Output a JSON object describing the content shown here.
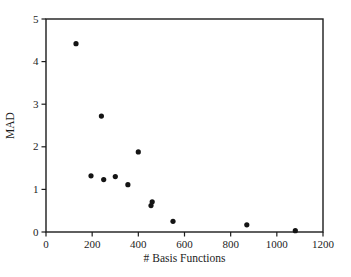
{
  "chart_data": {
    "type": "scatter",
    "title": "",
    "xlabel": "# Basis Functions",
    "ylabel": "MAD",
    "xlim": [
      0,
      1200
    ],
    "ylim": [
      0,
      5
    ],
    "x_ticks": [
      0,
      200,
      400,
      600,
      800,
      1000,
      1200
    ],
    "y_ticks": [
      0,
      1,
      2,
      3,
      4,
      5
    ],
    "grid": false,
    "legend": null,
    "marker": {
      "shape": "circle",
      "color": "#141414",
      "radius": 2.6
    },
    "frame_color": "#1c1c1c",
    "background_color": "#ffffff",
    "points": [
      {
        "x": 130,
        "y": 4.42
      },
      {
        "x": 195,
        "y": 1.32
      },
      {
        "x": 240,
        "y": 2.72
      },
      {
        "x": 250,
        "y": 1.23
      },
      {
        "x": 300,
        "y": 1.3
      },
      {
        "x": 355,
        "y": 1.11
      },
      {
        "x": 400,
        "y": 1.88
      },
      {
        "x": 455,
        "y": 0.62
      },
      {
        "x": 460,
        "y": 0.71
      },
      {
        "x": 550,
        "y": 0.25
      },
      {
        "x": 870,
        "y": 0.17
      },
      {
        "x": 1080,
        "y": 0.03
      }
    ]
  }
}
